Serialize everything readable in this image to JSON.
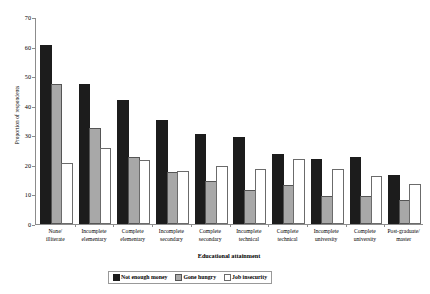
{
  "chart_data": {
    "type": "bar",
    "title": "",
    "subtitle": "",
    "xlabel": "Educational attainment",
    "ylabel": "Proportion of respondents",
    "ylim": [
      0,
      70
    ],
    "ytick_step": 10,
    "yticks": [
      "0",
      "10",
      "20",
      "30",
      "40",
      "50",
      "60",
      "70"
    ],
    "grid": false,
    "legend_position": "bottom",
    "categories": [
      "None/ illiterate",
      "Incomplete elementary",
      "Complete elementary",
      "Incomplete secondary",
      "Complete secondary",
      "Incomplete technical",
      "Complete technical",
      "Incomplete university",
      "Complete university",
      "Post-graduate/ master"
    ],
    "category_lines": [
      [
        "None/",
        "illiterate"
      ],
      [
        "Incomplete",
        "elementary"
      ],
      [
        "Complete",
        "elementary"
      ],
      [
        "Incomplete",
        "secondary"
      ],
      [
        "Complete",
        "secondary"
      ],
      [
        "Incomplete",
        "technical"
      ],
      [
        "Complete",
        "technical"
      ],
      [
        "Incomplete",
        "university"
      ],
      [
        "Complete",
        "university"
      ],
      [
        "Post-graduate/",
        "master"
      ]
    ],
    "series": [
      {
        "name": "Not enough money",
        "color": "#1c1c1c",
        "values": [
          60,
          47,
          41.5,
          34.5,
          30,
          29,
          23,
          21.5,
          22,
          16
        ]
      },
      {
        "name": "Gone hungry",
        "color": "#a8a8a8",
        "values": [
          47,
          32,
          22,
          17,
          14,
          11,
          12.5,
          9,
          9,
          7.5
        ]
      },
      {
        "name": "Job insecurity",
        "color": "#ffffff",
        "values": [
          20,
          25,
          21,
          17.5,
          19,
          18,
          21.5,
          18,
          15.5,
          13
        ]
      }
    ]
  }
}
